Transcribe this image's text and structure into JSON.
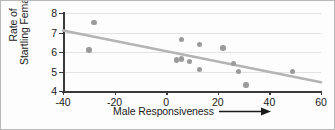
{
  "chart_data": {
    "type": "scatter",
    "title": "",
    "subtitle": "",
    "xlabel": "Male Responsiveness",
    "xlabel_arrow": "right-arrow",
    "ylabel": "Rate of Startling Females",
    "ylabel_lines": [
      "Rate of",
      "Startling Females"
    ],
    "xlim": [
      -40,
      60
    ],
    "ylim": [
      4,
      8
    ],
    "xticks": [
      -40,
      -20,
      0,
      20,
      40,
      60
    ],
    "yticks": [
      4,
      5,
      6,
      7,
      8
    ],
    "xtick_labels": [
      "-40",
      "-20",
      "0",
      "20",
      "40",
      "60"
    ],
    "ytick_labels": [
      "4",
      "5",
      "6",
      "7",
      "8"
    ],
    "grid": true,
    "grid_axis": "y",
    "legend": null,
    "marker_color": "#9a9a9a",
    "trendline_color": "#b4b4b4",
    "axis_color": "#3a3a3a",
    "grid_color": "#e3e3e3",
    "points": [
      {
        "x": -28,
        "y": 7.5
      },
      {
        "x": -30,
        "y": 6.1
      },
      {
        "x": 6,
        "y": 6.65
      },
      {
        "x": 13,
        "y": 6.4
      },
      {
        "x": 22,
        "y": 6.2
      },
      {
        "x": 4,
        "y": 5.6
      },
      {
        "x": 6,
        "y": 5.65
      },
      {
        "x": 9,
        "y": 5.5
      },
      {
        "x": 26,
        "y": 5.4
      },
      {
        "x": 13,
        "y": 5.1
      },
      {
        "x": 28,
        "y": 5.0
      },
      {
        "x": 49,
        "y": 5.0
      },
      {
        "x": 31,
        "y": 4.3
      }
    ],
    "trendline": {
      "type": "linear-fit",
      "x_start": -40,
      "y_start": 7.1,
      "x_end": 60,
      "y_end": 4.45,
      "slope": -0.0265,
      "intercept": 6.04
    }
  }
}
